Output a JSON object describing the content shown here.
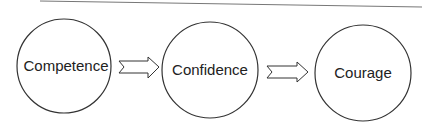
{
  "diagram": {
    "type": "flow",
    "nodes": [
      {
        "id": "competence",
        "label": "Competence",
        "cx": 64,
        "cy": 66,
        "r": 47
      },
      {
        "id": "confidence",
        "label": "Confidence",
        "cx": 210,
        "cy": 70,
        "r": 48
      },
      {
        "id": "courage",
        "label": "Courage",
        "cx": 363,
        "cy": 73,
        "r": 48
      }
    ],
    "edges": [
      {
        "from": "competence",
        "to": "confidence",
        "style": "notched-block-arrow"
      },
      {
        "from": "confidence",
        "to": "courage",
        "style": "notched-block-arrow"
      }
    ],
    "colors": {
      "stroke": "#333333",
      "text": "#222222",
      "top_rule": "#666666"
    }
  }
}
